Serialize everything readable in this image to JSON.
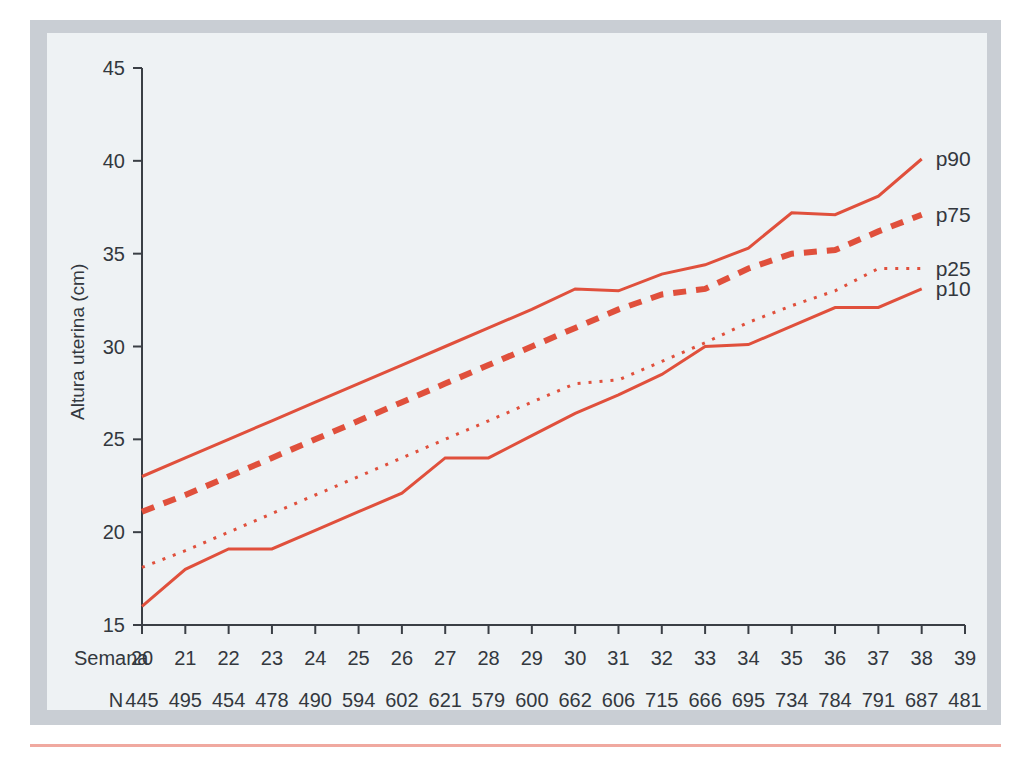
{
  "figure": {
    "frame_color": "#c9ced4",
    "plate_color": "#eef2f4",
    "rule_color": "#f0a9a0",
    "accent_color": "#e0503c",
    "axis_color": "#33383e"
  },
  "axes": {
    "ylabel": "Altura uterina (cm)",
    "y_ticks": [
      15,
      20,
      25,
      30,
      35,
      40,
      45
    ],
    "ylim": [
      15,
      45
    ],
    "x_row_label": "Semana",
    "n_row_label": "N"
  },
  "chart_data": {
    "type": "line",
    "title": "",
    "xlabel": "Semana",
    "ylabel": "Altura uterina (cm)",
    "xlim": [
      20,
      39
    ],
    "ylim": [
      15,
      45
    ],
    "grid": false,
    "legend_position": "right-inline",
    "categories": [
      20,
      21,
      22,
      23,
      24,
      25,
      26,
      27,
      28,
      29,
      30,
      31,
      32,
      33,
      34,
      35,
      36,
      37,
      38,
      39
    ],
    "x_tick_labels": [
      "20",
      "21",
      "22",
      "23",
      "24",
      "25",
      "26",
      "27",
      "28",
      "29",
      "30",
      "31",
      "32",
      "33",
      "34",
      "35",
      "36",
      "37",
      "38",
      "39"
    ],
    "n_values": [
      445,
      495,
      454,
      478,
      490,
      594,
      602,
      621,
      579,
      600,
      662,
      606,
      715,
      666,
      695,
      734,
      784,
      791,
      687,
      481
    ],
    "series": [
      {
        "name": "p90",
        "label": "p90",
        "style": "solid",
        "color": "#e0503c",
        "width": 3,
        "dasharray": "",
        "x": [
          20,
          21,
          22,
          23,
          24,
          25,
          26,
          27,
          28,
          29,
          30,
          31,
          32,
          33,
          34,
          35,
          36,
          37,
          38
        ],
        "values": [
          23.0,
          24.0,
          25.0,
          26.0,
          27.0,
          28.0,
          29.0,
          30.0,
          31.0,
          32.0,
          33.1,
          33.0,
          33.9,
          34.4,
          35.3,
          37.2,
          37.1,
          38.1,
          40.1
        ]
      },
      {
        "name": "p75",
        "label": "p75",
        "style": "dashed",
        "color": "#e0503c",
        "width": 6,
        "dasharray": "13 10",
        "x": [
          20,
          21,
          22,
          23,
          24,
          25,
          26,
          27,
          28,
          29,
          30,
          31,
          32,
          33,
          34,
          35,
          36,
          37,
          38
        ],
        "values": [
          21.1,
          22.0,
          23.0,
          24.0,
          25.0,
          26.0,
          27.0,
          28.0,
          29.0,
          30.0,
          31.0,
          32.0,
          32.8,
          33.1,
          34.2,
          35.0,
          35.2,
          36.2,
          37.1
        ]
      },
      {
        "name": "p25",
        "label": "p25",
        "style": "dotted",
        "color": "#e0503c",
        "width": 3,
        "dasharray": "3 8",
        "x": [
          20,
          21,
          22,
          23,
          24,
          25,
          26,
          27,
          28,
          29,
          30,
          31,
          32,
          33,
          34,
          35,
          36,
          37,
          38
        ],
        "values": [
          18.1,
          19.0,
          20.0,
          21.0,
          22.0,
          23.0,
          24.0,
          25.0,
          26.0,
          27.0,
          28.0,
          28.2,
          29.2,
          30.2,
          31.3,
          32.2,
          33.0,
          34.2,
          34.2
        ]
      },
      {
        "name": "p10",
        "label": "p10",
        "style": "solid",
        "color": "#e0503c",
        "width": 3,
        "dasharray": "",
        "x": [
          20,
          21,
          22,
          23,
          24,
          25,
          26,
          27,
          28,
          29,
          30,
          31,
          32,
          33,
          34,
          35,
          36,
          37,
          38
        ],
        "values": [
          16.0,
          18.0,
          19.1,
          19.1,
          20.1,
          21.1,
          22.1,
          24.0,
          24.0,
          25.2,
          26.4,
          27.4,
          28.5,
          30.0,
          30.1,
          31.1,
          32.1,
          32.1,
          33.1
        ]
      }
    ]
  }
}
